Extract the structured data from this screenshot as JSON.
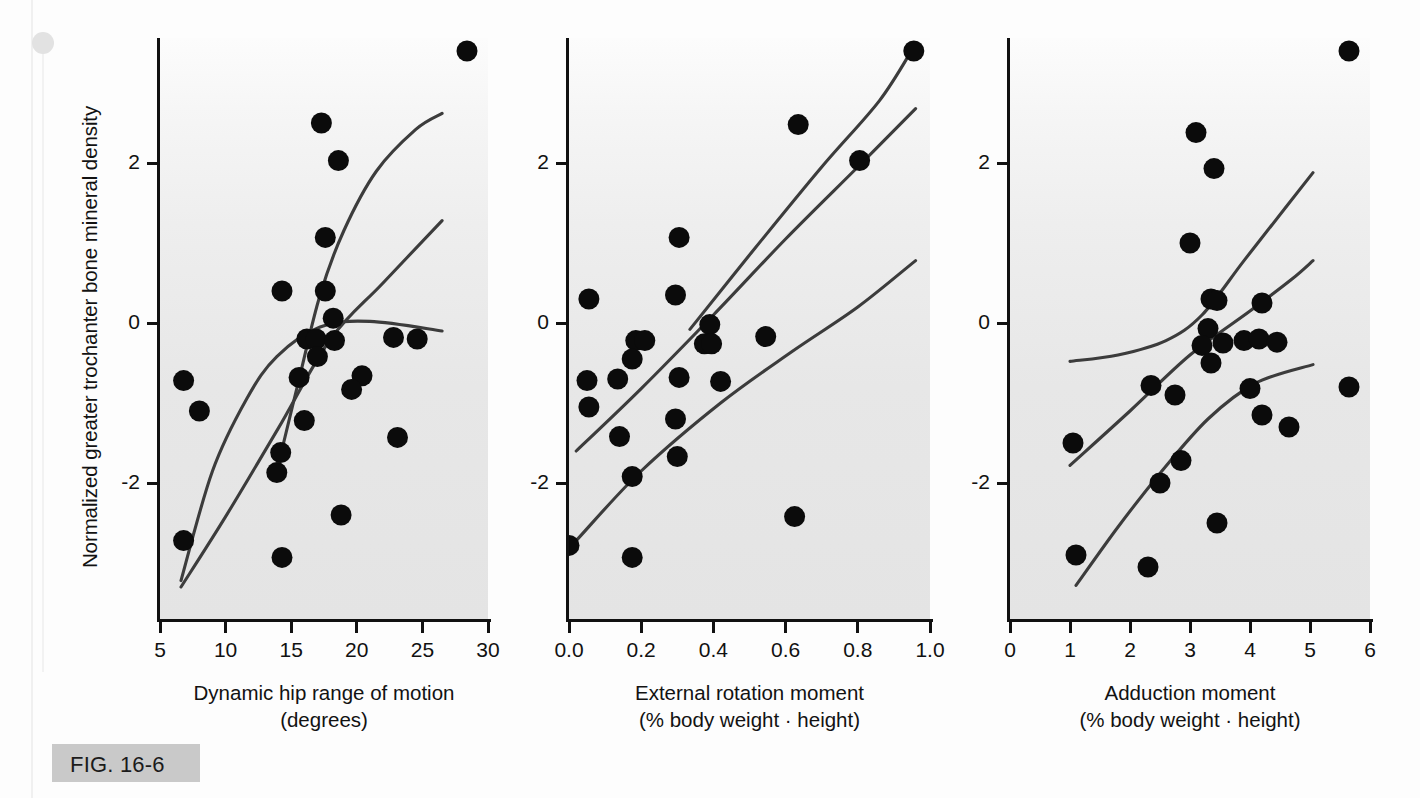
{
  "figure": {
    "caption_label": "FIG. 16-6",
    "y_axis_title": "Normalized greater trochanter bone mineral density",
    "y_ticks": [
      "2",
      "0",
      "-2"
    ],
    "ink_color": "#111111",
    "curve_color": "#3c3c3c",
    "panel_bg_color": "#e8e8e8",
    "caption_bar_color": "#c9c9c9"
  },
  "chart_data": [
    {
      "type": "scatter",
      "panel": 1,
      "title": "",
      "xlabel": "Dynamic hip range of motion",
      "xlabel_units": "(degrees)",
      "ylabel": "Normalized greater trochanter bone mineral density",
      "xlim": [
        5,
        30
      ],
      "ylim": [
        -3.6,
        3.7
      ],
      "xticks": [
        5,
        10,
        15,
        20,
        25,
        30
      ],
      "yticks": [
        2,
        0,
        -2
      ],
      "grid": false,
      "legend": "none",
      "points": [
        {
          "x": 28.4,
          "y": 3.4
        },
        {
          "x": 17.3,
          "y": 2.5
        },
        {
          "x": 18.6,
          "y": 2.03
        },
        {
          "x": 17.6,
          "y": 1.07
        },
        {
          "x": 14.3,
          "y": 0.4
        },
        {
          "x": 17.6,
          "y": 0.4
        },
        {
          "x": 18.2,
          "y": 0.06
        },
        {
          "x": 16.2,
          "y": -0.2
        },
        {
          "x": 16.9,
          "y": -0.2
        },
        {
          "x": 18.3,
          "y": -0.22
        },
        {
          "x": 17.0,
          "y": -0.42
        },
        {
          "x": 22.8,
          "y": -0.18
        },
        {
          "x": 24.6,
          "y": -0.2
        },
        {
          "x": 6.8,
          "y": -0.72
        },
        {
          "x": 15.6,
          "y": -0.68
        },
        {
          "x": 20.4,
          "y": -0.66
        },
        {
          "x": 19.6,
          "y": -0.83
        },
        {
          "x": 8.0,
          "y": -1.1
        },
        {
          "x": 16.0,
          "y": -1.22
        },
        {
          "x": 14.2,
          "y": -1.62
        },
        {
          "x": 23.1,
          "y": -1.43
        },
        {
          "x": 13.9,
          "y": -1.87
        },
        {
          "x": 6.8,
          "y": -2.72
        },
        {
          "x": 18.8,
          "y": -2.4
        },
        {
          "x": 14.3,
          "y": -2.93
        }
      ],
      "curves": [
        {
          "name": "upper-confidence-band",
          "points": [
            [
              13.9,
              -1.85
            ],
            [
              15.6,
              -0.7
            ],
            [
              17.2,
              0.35
            ],
            [
              19.0,
              1.15
            ],
            [
              21.5,
              1.9
            ],
            [
              24.5,
              2.42
            ],
            [
              26.5,
              2.62
            ]
          ]
        },
        {
          "name": "regression-line",
          "points": [
            [
              6.6,
              -3.3
            ],
            [
              10.0,
              -2.42
            ],
            [
              14.0,
              -1.32
            ],
            [
              18.0,
              -0.2
            ],
            [
              22.0,
              0.5
            ],
            [
              26.5,
              1.28
            ]
          ]
        },
        {
          "name": "lower-confidence-band",
          "points": [
            [
              6.6,
              -3.22
            ],
            [
              9.0,
              -1.85
            ],
            [
              11.6,
              -0.95
            ],
            [
              13.9,
              -0.42
            ],
            [
              17.2,
              -0.05
            ],
            [
              21.0,
              0.02
            ],
            [
              26.5,
              -0.1
            ]
          ]
        }
      ]
    },
    {
      "type": "scatter",
      "panel": 2,
      "title": "",
      "xlabel": "External rotation moment",
      "xlabel_units": "(% body weight · height)",
      "ylabel": "Normalized greater trochanter bone mineral density",
      "xlim": [
        0.0,
        1.0
      ],
      "ylim": [
        -3.6,
        3.7
      ],
      "xticks": [
        0.0,
        0.2,
        0.4,
        0.6,
        0.8,
        1.0
      ],
      "yticks": [
        2,
        0,
        -2
      ],
      "grid": false,
      "legend": "none",
      "points": [
        {
          "x": 0.955,
          "y": 3.4
        },
        {
          "x": 0.635,
          "y": 2.48
        },
        {
          "x": 0.805,
          "y": 2.03
        },
        {
          "x": 0.305,
          "y": 1.07
        },
        {
          "x": 0.055,
          "y": 0.3
        },
        {
          "x": 0.295,
          "y": 0.35
        },
        {
          "x": 0.39,
          "y": -0.02
        },
        {
          "x": 0.185,
          "y": -0.22
        },
        {
          "x": 0.21,
          "y": -0.22
        },
        {
          "x": 0.375,
          "y": -0.26
        },
        {
          "x": 0.395,
          "y": -0.26
        },
        {
          "x": 0.545,
          "y": -0.17
        },
        {
          "x": 0.175,
          "y": -0.45
        },
        {
          "x": 0.05,
          "y": -0.72
        },
        {
          "x": 0.135,
          "y": -0.7
        },
        {
          "x": 0.305,
          "y": -0.68
        },
        {
          "x": 0.42,
          "y": -0.73
        },
        {
          "x": 0.055,
          "y": -1.05
        },
        {
          "x": 0.295,
          "y": -1.2
        },
        {
          "x": 0.14,
          "y": -1.42
        },
        {
          "x": 0.3,
          "y": -1.67
        },
        {
          "x": 0.175,
          "y": -1.92
        },
        {
          "x": 0.625,
          "y": -2.42
        },
        {
          "x": 0.0,
          "y": -2.78
        },
        {
          "x": 0.175,
          "y": -2.93
        }
      ],
      "curves": [
        {
          "name": "upper-confidence-band",
          "points": [
            [
              0.335,
              -0.08
            ],
            [
              0.5,
              0.85
            ],
            [
              0.7,
              1.95
            ],
            [
              0.86,
              2.78
            ],
            [
              0.955,
              3.45
            ]
          ]
        },
        {
          "name": "regression-line",
          "points": [
            [
              0.02,
              -1.6
            ],
            [
              0.2,
              -0.82
            ],
            [
              0.4,
              0.1
            ],
            [
              0.6,
              1.05
            ],
            [
              0.8,
              1.95
            ],
            [
              0.96,
              2.68
            ]
          ]
        },
        {
          "name": "lower-confidence-band",
          "points": [
            [
              0.02,
              -2.72
            ],
            [
              0.2,
              -1.85
            ],
            [
              0.42,
              -1.0
            ],
            [
              0.62,
              -0.35
            ],
            [
              0.8,
              0.2
            ],
            [
              0.96,
              0.78
            ]
          ]
        }
      ]
    },
    {
      "type": "scatter",
      "panel": 3,
      "title": "",
      "xlabel": "Adduction moment",
      "xlabel_units": "(% body weight · height)",
      "ylabel": "Normalized greater trochanter bone mineral density",
      "xlim": [
        0,
        6
      ],
      "ylim": [
        -3.6,
        3.7
      ],
      "xticks": [
        0,
        1,
        2,
        3,
        4,
        5,
        6
      ],
      "yticks": [
        2,
        0,
        -2
      ],
      "grid": false,
      "legend": "none",
      "points": [
        {
          "x": 5.65,
          "y": 3.4
        },
        {
          "x": 3.1,
          "y": 2.38
        },
        {
          "x": 3.4,
          "y": 1.93
        },
        {
          "x": 3.0,
          "y": 1.0
        },
        {
          "x": 3.35,
          "y": 0.3
        },
        {
          "x": 4.2,
          "y": 0.25
        },
        {
          "x": 3.45,
          "y": 0.28
        },
        {
          "x": 3.3,
          "y": -0.07
        },
        {
          "x": 3.2,
          "y": -0.28
        },
        {
          "x": 3.55,
          "y": -0.25
        },
        {
          "x": 3.9,
          "y": -0.22
        },
        {
          "x": 4.15,
          "y": -0.2
        },
        {
          "x": 4.45,
          "y": -0.24
        },
        {
          "x": 3.35,
          "y": -0.5
        },
        {
          "x": 2.35,
          "y": -0.78
        },
        {
          "x": 4.0,
          "y": -0.82
        },
        {
          "x": 5.65,
          "y": -0.8
        },
        {
          "x": 2.75,
          "y": -0.9
        },
        {
          "x": 4.2,
          "y": -1.15
        },
        {
          "x": 4.65,
          "y": -1.3
        },
        {
          "x": 1.05,
          "y": -1.5
        },
        {
          "x": 2.85,
          "y": -1.72
        },
        {
          "x": 2.5,
          "y": -2.0
        },
        {
          "x": 3.45,
          "y": -2.5
        },
        {
          "x": 1.1,
          "y": -2.9
        },
        {
          "x": 2.3,
          "y": -3.05
        }
      ],
      "curves": [
        {
          "name": "upper-confidence-band",
          "points": [
            [
              1.0,
              -0.48
            ],
            [
              1.8,
              -0.4
            ],
            [
              2.6,
              -0.22
            ],
            [
              3.2,
              0.1
            ],
            [
              3.9,
              0.78
            ],
            [
              4.6,
              1.45
            ],
            [
              5.05,
              1.88
            ]
          ]
        },
        {
          "name": "regression-line",
          "points": [
            [
              1.0,
              -1.78
            ],
            [
              2.0,
              -1.1
            ],
            [
              3.0,
              -0.4
            ],
            [
              4.0,
              0.15
            ],
            [
              4.7,
              0.55
            ],
            [
              5.05,
              0.78
            ]
          ]
        },
        {
          "name": "lower-confidence-band",
          "points": [
            [
              1.1,
              -3.28
            ],
            [
              1.8,
              -2.55
            ],
            [
              2.5,
              -1.88
            ],
            [
              3.3,
              -1.2
            ],
            [
              4.1,
              -0.75
            ],
            [
              5.05,
              -0.52
            ]
          ]
        }
      ]
    }
  ],
  "panels": [
    {
      "id": "panel-dynamic-hip-rom",
      "xlabel": "Dynamic hip range of motion",
      "xlabel_units": "(degrees)",
      "xtick_labels": [
        "5",
        "10",
        "15",
        "20",
        "25",
        "30"
      ]
    },
    {
      "id": "panel-external-rotation-moment",
      "xlabel": "External rotation moment",
      "xlabel_units": "(% body weight · height)",
      "xtick_labels": [
        "0.0",
        "0.2",
        "0.4",
        "0.6",
        "0.8",
        "1.0"
      ]
    },
    {
      "id": "panel-adduction-moment",
      "xlabel": "Adduction moment",
      "xlabel_units": "(% body weight · height)",
      "xtick_labels": [
        "0",
        "1",
        "2",
        "3",
        "4",
        "5",
        "6"
      ]
    }
  ]
}
